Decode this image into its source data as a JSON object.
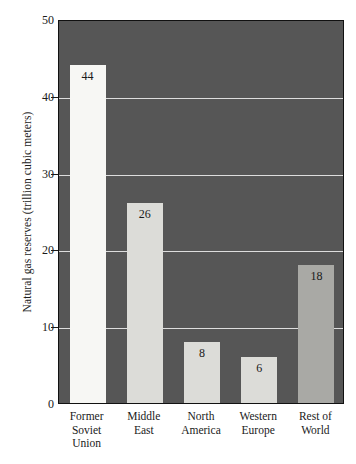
{
  "chart_data": {
    "type": "bar",
    "title": "",
    "xlabel": "",
    "ylabel": "Natural gas reserves (trillion cubic meters)",
    "ylim": [
      0,
      50
    ],
    "yticks": [
      0,
      10,
      20,
      30,
      40,
      50
    ],
    "grid": "horizontal-gridlines-at-10-20-30-40",
    "legend": "none",
    "plot_background_color": "#565656",
    "categories": [
      "Former Soviet Union",
      "Middle East",
      "North America",
      "Western Europe",
      "Rest of World"
    ],
    "category_lines": [
      [
        "Former",
        "Soviet",
        "Union"
      ],
      [
        "Middle",
        "East"
      ],
      [
        "North",
        "America"
      ],
      [
        "Western",
        "Europe"
      ],
      [
        "Rest of",
        "World"
      ]
    ],
    "values": [
      44,
      26,
      8,
      6,
      18
    ],
    "value_labels": [
      "44",
      "26",
      "8",
      "6",
      "18"
    ],
    "bar_colors": [
      "#f7f7f4",
      "#dcdcd8",
      "#dcdcd8",
      "#dcdcd8",
      "#a9a9a5"
    ],
    "ytick_labels": [
      "0",
      "10",
      "20",
      "30",
      "40",
      "50"
    ]
  }
}
